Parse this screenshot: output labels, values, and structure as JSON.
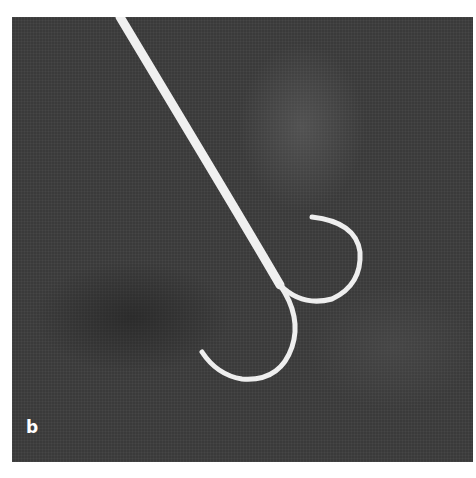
{
  "figure": {
    "panel_label": "b",
    "colors": {
      "background": "#3a3a3a",
      "wire": "#f2f2f2",
      "page": "#ffffff"
    }
  }
}
